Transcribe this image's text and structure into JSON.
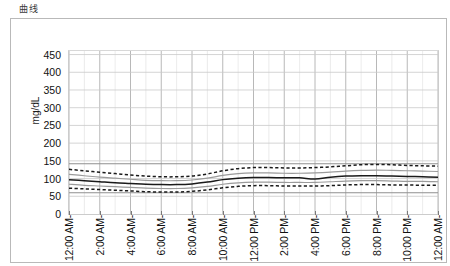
{
  "panel": {
    "title": "曲线"
  },
  "chart_data": {
    "type": "line",
    "title": "曲线",
    "xlabel": "",
    "ylabel": "mg/dL",
    "ylim": [
      0,
      460
    ],
    "yticks": [
      0,
      50,
      100,
      150,
      200,
      250,
      300,
      350,
      400,
      450
    ],
    "grid": true,
    "legend_position": "none",
    "xlim_hours": [
      0,
      24
    ],
    "x_tick_labels": [
      "12:00 AM-",
      "2:00 AM-",
      "4:00 AM-",
      "6:00 AM-",
      "8:00 AM-",
      "10:00 AM-",
      "12:00 PM-",
      "2:00 PM-",
      "4:00 PM-",
      "6:00 PM-",
      "8:00 PM-",
      "10:00 PM-",
      "12:00 AM-"
    ],
    "x_tick_hours": [
      0,
      2,
      4,
      6,
      8,
      10,
      12,
      14,
      16,
      18,
      20,
      22,
      24
    ],
    "x_minor_gridline_step_hours": 1,
    "x": [
      0,
      1,
      2,
      3,
      4,
      5,
      6,
      7,
      8,
      9,
      10,
      11,
      12,
      13,
      14,
      15,
      16,
      17,
      18,
      19,
      20,
      21,
      22,
      23,
      24
    ],
    "series": [
      {
        "name": "upper-band-dashed",
        "style": "dashed",
        "color": "#1a1a1a",
        "values": [
          126,
          122,
          118,
          114,
          110,
          107,
          105,
          105,
          107,
          113,
          122,
          128,
          131,
          131,
          130,
          130,
          131,
          133,
          136,
          139,
          140,
          139,
          137,
          136,
          135
        ]
      },
      {
        "name": "upper-quartile-gray",
        "style": "solid",
        "color": "#9b9b9b",
        "values": [
          112,
          108,
          104,
          101,
          98,
          95,
          94,
          94,
          96,
          101,
          109,
          114,
          116,
          116,
          115,
          115,
          116,
          118,
          121,
          123,
          124,
          123,
          122,
          121,
          120
        ]
      },
      {
        "name": "median-solid",
        "style": "solid",
        "color": "#1a1a1a",
        "values": [
          97,
          94,
          91,
          88,
          86,
          84,
          83,
          83,
          85,
          90,
          97,
          101,
          103,
          103,
          102,
          102,
          99,
          104,
          107,
          108,
          108,
          107,
          106,
          105,
          104
        ]
      },
      {
        "name": "lower-quartile-gray",
        "style": "solid",
        "color": "#9b9b9b",
        "values": [
          84,
          81,
          79,
          77,
          75,
          73,
          72,
          72,
          74,
          78,
          84,
          88,
          90,
          90,
          89,
          89,
          89,
          91,
          93,
          94,
          94,
          93,
          92,
          92,
          91
        ]
      },
      {
        "name": "lower-band-dashed",
        "style": "dashed",
        "color": "#1a1a1a",
        "values": [
          73,
          71,
          69,
          67,
          65,
          63,
          62,
          62,
          64,
          68,
          74,
          78,
          80,
          80,
          79,
          79,
          79,
          80,
          82,
          83,
          83,
          82,
          82,
          81,
          81
        ]
      }
    ],
    "reference_lines": [
      {
        "name": "upper-reference",
        "value": 142,
        "color": "#8f8f8f"
      },
      {
        "name": "lower-reference",
        "value": 60,
        "color": "#8f8f8f"
      }
    ]
  }
}
